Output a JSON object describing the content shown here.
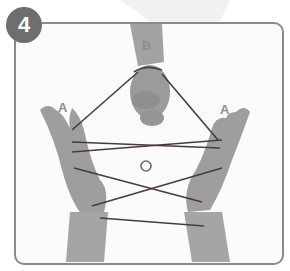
{
  "step": {
    "number": "4"
  },
  "labels": {
    "top_hand": "B",
    "left_hand": "A",
    "right_hand": "A",
    "center_marker": "O"
  },
  "colors": {
    "frame_border": "#8a8a8a",
    "badge_fill": "#6e6e6e",
    "badge_text": "#ffffff",
    "label_text": "#8d8d8d",
    "string": "#4a3a3e",
    "skin": "#9a9a9a"
  }
}
